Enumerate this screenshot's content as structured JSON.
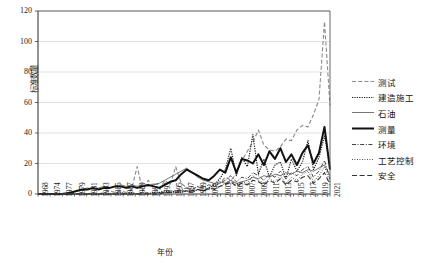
{
  "chart_data": {
    "type": "line",
    "title": "",
    "xlabel": "年份",
    "ylabel": "标准数量",
    "ylim": [
      0,
      120
    ],
    "yticks": [
      0,
      20,
      40,
      60,
      80,
      100,
      120
    ],
    "grid": true,
    "legend_position": "right",
    "x": [
      1968,
      1969,
      1970,
      1971,
      1972,
      1973,
      1974,
      1975,
      1976,
      1977,
      1978,
      1979,
      1980,
      1981,
      1982,
      1983,
      1984,
      1985,
      1986,
      1987,
      1988,
      1989,
      1990,
      1991,
      1992,
      1993,
      1994,
      1995,
      1996,
      1997,
      1998,
      1999,
      2000,
      2001,
      2002,
      2003,
      2004,
      2005,
      2006,
      2007,
      2008,
      2009,
      2010,
      2011,
      2012,
      2013,
      2014,
      2015,
      2016,
      2017,
      2018,
      2019,
      2020,
      2021
    ],
    "xtick_labels": [
      "1968",
      "1974",
      "1977",
      "1979",
      "1981",
      "1983",
      "1985",
      "1987",
      "1989",
      "1991",
      "1993",
      "1995",
      "1997",
      "1999",
      "2001",
      "2003",
      "2005",
      "2007",
      "2009",
      "2011",
      "2013",
      "2015",
      "2017",
      "2019",
      "2021"
    ],
    "series": [
      {
        "name": "测试",
        "style": "dashed",
        "color": "#8a8a8a",
        "width": 1.1,
        "values": [
          0,
          0,
          0,
          0,
          0,
          0,
          0,
          0,
          1,
          0,
          1,
          0,
          1,
          2,
          1,
          2,
          1,
          3,
          18,
          2,
          9,
          4,
          2,
          9,
          6,
          18,
          7,
          4,
          2,
          5,
          2,
          3,
          7,
          7,
          11,
          9,
          13,
          22,
          28,
          34,
          42,
          32,
          29,
          28,
          31,
          36,
          35,
          42,
          45,
          44,
          52,
          62,
          113,
          58
        ]
      },
      {
        "name": "建造施工",
        "style": "dotted",
        "color": "#1c1c1c",
        "width": 1.2,
        "values": [
          0,
          0,
          0,
          0,
          0,
          0,
          0,
          0,
          0,
          0,
          0,
          0,
          0,
          0,
          0,
          1,
          0,
          1,
          0,
          1,
          0,
          1,
          1,
          2,
          1,
          2,
          1,
          2,
          1,
          3,
          2,
          4,
          6,
          10,
          16,
          30,
          12,
          24,
          18,
          39,
          13,
          23,
          11,
          19,
          21,
          10,
          23,
          15,
          21,
          35,
          16,
          24,
          38,
          20
        ]
      },
      {
        "name": "石油",
        "style": "solid-thin",
        "color": "#666666",
        "width": 0.9,
        "values": [
          0,
          0,
          0,
          0,
          0,
          1,
          1,
          2,
          3,
          4,
          3,
          4,
          5,
          4,
          5,
          6,
          5,
          6,
          5,
          6,
          5,
          6,
          7,
          9,
          11,
          13,
          15,
          17,
          14,
          11,
          9,
          8,
          7,
          8,
          7,
          9,
          7,
          8,
          9,
          11,
          10,
          12,
          11,
          13,
          12,
          14,
          13,
          15,
          14,
          16,
          15,
          17,
          19,
          12
        ]
      },
      {
        "name": "测量",
        "style": "solid-thick",
        "color": "#111111",
        "width": 2.0,
        "values": [
          0,
          0,
          0,
          0,
          0,
          0,
          1,
          2,
          3,
          3,
          4,
          3,
          4,
          4,
          5,
          5,
          4,
          5,
          4,
          5,
          6,
          5,
          4,
          6,
          8,
          9,
          13,
          16,
          14,
          12,
          10,
          9,
          12,
          16,
          14,
          24,
          14,
          23,
          22,
          20,
          26,
          19,
          28,
          23,
          30,
          21,
          26,
          19,
          27,
          32,
          20,
          27,
          44,
          16
        ]
      },
      {
        "name": "环境",
        "style": "dashdot",
        "color": "#444444",
        "width": 1.0,
        "values": [
          0,
          0,
          0,
          0,
          0,
          0,
          0,
          0,
          0,
          0,
          0,
          0,
          0,
          0,
          0,
          0,
          0,
          0,
          0,
          0,
          1,
          0,
          1,
          1,
          2,
          2,
          3,
          4,
          3,
          5,
          4,
          6,
          5,
          7,
          9,
          12,
          8,
          11,
          10,
          14,
          12,
          9,
          13,
          11,
          15,
          10,
          14,
          12,
          16,
          18,
          11,
          15,
          22,
          10
        ]
      },
      {
        "name": "工艺控制",
        "style": "dotted-fine",
        "color": "#2b2b2b",
        "width": 0.9,
        "values": [
          0,
          0,
          0,
          0,
          0,
          0,
          0,
          0,
          0,
          0,
          0,
          0,
          0,
          0,
          0,
          0,
          0,
          0,
          0,
          0,
          0,
          0,
          0,
          0,
          1,
          1,
          2,
          2,
          1,
          3,
          2,
          3,
          4,
          5,
          7,
          9,
          6,
          8,
          7,
          12,
          9,
          7,
          10,
          8,
          12,
          7,
          11,
          9,
          13,
          15,
          8,
          12,
          18,
          8
        ]
      },
      {
        "name": "安全",
        "style": "dashed-wide",
        "color": "#333333",
        "width": 1.1,
        "values": [
          0,
          0,
          0,
          0,
          0,
          0,
          0,
          0,
          0,
          0,
          0,
          0,
          0,
          0,
          0,
          0,
          0,
          0,
          0,
          0,
          0,
          0,
          0,
          1,
          1,
          1,
          2,
          2,
          2,
          3,
          2,
          4,
          3,
          5,
          6,
          8,
          5,
          7,
          6,
          9,
          8,
          6,
          9,
          7,
          10,
          6,
          9,
          8,
          11,
          12,
          7,
          10,
          14,
          6
        ]
      }
    ]
  },
  "axes": {
    "plot_left": 38,
    "plot_right": 330,
    "plot_top": 11,
    "plot_bottom": 194
  },
  "legend": {
    "items": [
      {
        "label": "测试"
      },
      {
        "label": "建造施工"
      },
      {
        "label": "石油"
      },
      {
        "label": "测量"
      },
      {
        "label": "环境"
      },
      {
        "label": "工艺控制"
      },
      {
        "label": "安全"
      }
    ]
  }
}
